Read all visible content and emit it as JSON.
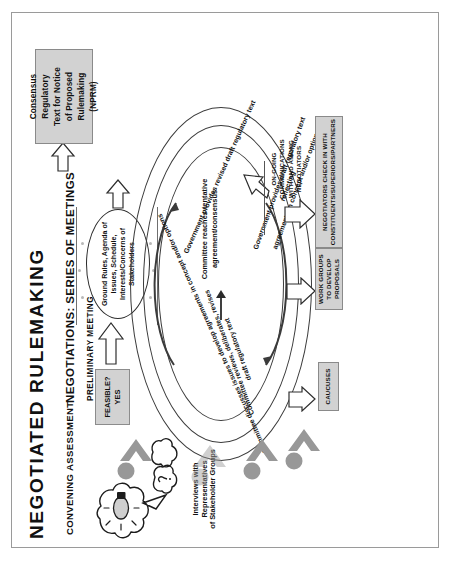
{
  "document": {
    "title": "NEGOTIATED RULEMAKING",
    "orientation": "rotated-90-ccw",
    "page_border": true
  },
  "sections": {
    "convening_assessment": {
      "heading": "CONVENING ASSESSMENT",
      "caption": "Interviews with Representatives\nof Stakeholder Groups",
      "decision_box": "FEASIBLE?\nYES",
      "icon": "lightbulb-and-speech-clouds"
    },
    "negotiations": {
      "heading": "NEGOTIATIONS: SERIES OF MEETINGS",
      "subheading": "PRELIMINARY MEETING",
      "preliminary_oval": "Ground Rules,\nAgenda of Issues, Schedule,\nInterests/Concerns of\nStakeholders"
    }
  },
  "spiral": {
    "steps": [
      "Committee discusses issues to develop agreements in concept and/or options",
      "Committee reviews, deliberates, revises\ndraft regulatory text",
      "Government provides draft regulatory text reflecting\nagreements in concept and/or options",
      "Government provides revised draft regulatory text"
    ],
    "center": "Committee reaches tentative\nagreement/consensus"
  },
  "side_boxes": [
    {
      "name": "caucuses",
      "label": "CAUCUSES"
    },
    {
      "name": "work-groups",
      "label": "WORK GROUPS\nTO DEVELOP\nPROPOSALS"
    },
    {
      "name": "negotiators-check-in",
      "label": "NEGOTIATORS CHECK IN WITH\nCONSTITUENTS/SUPERIORS/PARTNERS"
    }
  ],
  "annotations": {
    "ongoing_communications": "ON-GOING\nCOMMUNICATIONS\nWITH AND AMONG\nNEGOTIATORS"
  },
  "output_box": {
    "label": "Consensus\nRegulatory\nText for Notice\nof Proposed\nRulemaking\n(NPRM)"
  },
  "colors": {
    "box_fill": "#d2d2d2",
    "box_border": "#8a8a8a",
    "person_gray": "#989898",
    "line_dark": "#3b3b3b",
    "page_border": "#9a9a9a",
    "text": "#111111"
  }
}
